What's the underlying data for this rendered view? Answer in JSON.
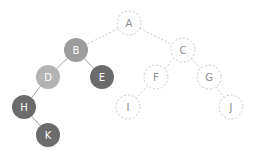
{
  "diagram": {
    "type": "binary-tree",
    "node_radius": 12,
    "colors": {
      "mid": "#9c9c9c",
      "light": "#b3b3b3",
      "dark": "#6b6b6b",
      "dashed_stroke": "#c6c6c6",
      "dashed_text": "#8a8a8a",
      "solid_edge": "#a0a0a0",
      "solid_text": "#ffffff"
    },
    "nodes": [
      {
        "id": "A",
        "label": "A",
        "x": 129,
        "y": 23,
        "style": "dashed"
      },
      {
        "id": "B",
        "label": "B",
        "x": 76,
        "y": 50,
        "style": "mid"
      },
      {
        "id": "C",
        "label": "C",
        "x": 183,
        "y": 50,
        "style": "dashed"
      },
      {
        "id": "D",
        "label": "D",
        "x": 48,
        "y": 77,
        "style": "light"
      },
      {
        "id": "E",
        "label": "E",
        "x": 102,
        "y": 77,
        "style": "dark"
      },
      {
        "id": "F",
        "label": "F",
        "x": 156,
        "y": 77,
        "style": "dashed"
      },
      {
        "id": "G",
        "label": "G",
        "x": 209,
        "y": 77,
        "style": "dashed"
      },
      {
        "id": "H",
        "label": "H",
        "x": 24,
        "y": 107,
        "style": "dark"
      },
      {
        "id": "I",
        "label": "I",
        "x": 128,
        "y": 107,
        "style": "dashed"
      },
      {
        "id": "J",
        "label": "J",
        "x": 231,
        "y": 107,
        "style": "dashed"
      },
      {
        "id": "K",
        "label": "K",
        "x": 48,
        "y": 135,
        "style": "dark"
      }
    ],
    "edges": [
      {
        "from": "A",
        "to": "B",
        "style": "dashed"
      },
      {
        "from": "A",
        "to": "C",
        "style": "dashed"
      },
      {
        "from": "B",
        "to": "D",
        "style": "solid"
      },
      {
        "from": "B",
        "to": "E",
        "style": "solid"
      },
      {
        "from": "C",
        "to": "F",
        "style": "dashed"
      },
      {
        "from": "C",
        "to": "G",
        "style": "dashed"
      },
      {
        "from": "D",
        "to": "H",
        "style": "solid"
      },
      {
        "from": "F",
        "to": "I",
        "style": "dashed"
      },
      {
        "from": "G",
        "to": "J",
        "style": "dashed"
      },
      {
        "from": "H",
        "to": "K",
        "style": "solid"
      }
    ]
  }
}
